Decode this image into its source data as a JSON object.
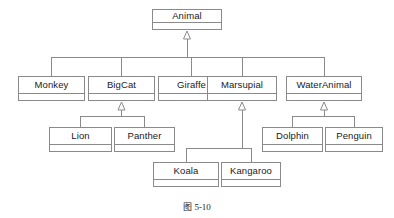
{
  "diagram": {
    "type": "uml-class-inheritance",
    "caption": "图 5-10",
    "colors": {
      "box_border": "#8a8a8a",
      "line": "#8a8a8a",
      "box_fill": "#ffffff",
      "text": "#1a1a1a",
      "background": "#ffffff"
    },
    "classes": [
      {
        "id": "animal",
        "name": "Animal",
        "level": 1,
        "x": 152,
        "y": 9,
        "w": 70,
        "h": 21
      },
      {
        "id": "monkey",
        "name": "Monkey",
        "level": 2,
        "x": 18,
        "y": 76,
        "w": 67,
        "h": 25
      },
      {
        "id": "bigcat",
        "name": "BigCat",
        "level": 2,
        "x": 88,
        "y": 76,
        "w": 67,
        "h": 25
      },
      {
        "id": "giraffe",
        "name": "Giraffe",
        "level": 2,
        "x": 158,
        "y": 76,
        "w": 67,
        "h": 25
      },
      {
        "id": "marsupial",
        "name": "Marsupial",
        "level": 2,
        "x": 207,
        "y": 76,
        "w": 70,
        "h": 25
      },
      {
        "id": "wateranimal",
        "name": "WaterAnimal",
        "level": 2,
        "x": 286,
        "y": 76,
        "w": 76,
        "h": 25
      },
      {
        "id": "lion",
        "name": "Lion",
        "level": 3,
        "x": 49,
        "y": 127,
        "w": 63,
        "h": 25
      },
      {
        "id": "panther",
        "name": "Panther",
        "level": 3,
        "x": 114,
        "y": 127,
        "w": 61,
        "h": 25
      },
      {
        "id": "dolphin",
        "name": "Dolphin",
        "level": 3,
        "x": 262,
        "y": 127,
        "w": 61,
        "h": 25
      },
      {
        "id": "penguin",
        "name": "Penguin",
        "level": 3,
        "x": 325,
        "y": 127,
        "w": 58,
        "h": 25
      },
      {
        "id": "koala",
        "name": "Koala",
        "level": 4,
        "x": 153,
        "y": 162,
        "w": 66,
        "h": 25
      },
      {
        "id": "kangaroo",
        "name": "Kangaroo",
        "level": 4,
        "x": 221,
        "y": 162,
        "w": 60,
        "h": 25
      }
    ],
    "generalizations": [
      {
        "subclass": "monkey",
        "superclass": "animal"
      },
      {
        "subclass": "bigcat",
        "superclass": "animal"
      },
      {
        "subclass": "giraffe",
        "superclass": "animal"
      },
      {
        "subclass": "marsupial",
        "superclass": "animal"
      },
      {
        "subclass": "wateranimal",
        "superclass": "animal"
      },
      {
        "subclass": "lion",
        "superclass": "bigcat"
      },
      {
        "subclass": "panther",
        "superclass": "bigcat"
      },
      {
        "subclass": "dolphin",
        "superclass": "wateranimal"
      },
      {
        "subclass": "penguin",
        "superclass": "wateranimal"
      },
      {
        "subclass": "koala",
        "superclass": "marsupial"
      },
      {
        "subclass": "kangaroo",
        "superclass": "marsupial"
      }
    ],
    "caption_position": {
      "x": 0,
      "y": 200
    }
  }
}
